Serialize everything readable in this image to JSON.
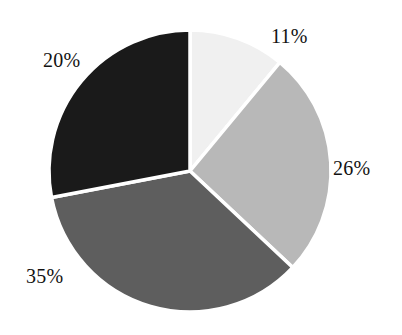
{
  "chart_data": {
    "type": "pie",
    "title": "",
    "subtitle": "",
    "xlabel": "",
    "ylabel": "",
    "grid": false,
    "legend": "none",
    "label_format": "percent",
    "start_angle_deg": 0,
    "direction": "clockwise",
    "background_color": "#ffffff",
    "separator_color": "#ffffff",
    "label_color": "#121212",
    "categories": [
      "Slice 1",
      "Slice 2",
      "Slice 3",
      "Slice 4"
    ],
    "values": [
      11,
      26,
      35,
      20
    ],
    "labels": [
      "11%",
      "26%",
      "35%",
      "20%"
    ],
    "colors": [
      "#f0f0f0",
      "#b8b8b8",
      "#5e5e5e",
      "#1a1a1a"
    ],
    "slices": [
      {
        "label": "11%",
        "value": 11,
        "color": "#f0f0f0",
        "start_angle_deg": 0,
        "end_angle_deg": 39.6,
        "label_x": 271,
        "label_y": 26
      },
      {
        "label": "26%",
        "value": 26,
        "color": "#b8b8b8",
        "start_angle_deg": 39.6,
        "end_angle_deg": 133.2,
        "label_x": 333,
        "label_y": 158
      },
      {
        "label": "35%",
        "value": 35,
        "color": "#5e5e5e",
        "start_angle_deg": 133.2,
        "end_angle_deg": 259.2,
        "label_x": 26,
        "label_y": 266
      },
      {
        "label": "20%",
        "value": 20,
        "color": "#1a1a1a",
        "start_angle_deg": 259.2,
        "end_angle_deg": 360,
        "label_x": 43,
        "label_y": 50
      }
    ],
    "geometry": {
      "center_x": 190,
      "center_y": 171,
      "radius": 141
    }
  }
}
